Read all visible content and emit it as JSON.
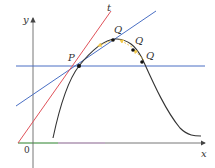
{
  "figure": {
    "axes": {
      "x_label": "x",
      "y_label": "y",
      "origin_label": "0"
    },
    "point_labels": {
      "p": "P",
      "q1": "Q",
      "q2": "Q",
      "q3": "Q",
      "tangent": "t"
    },
    "colors": {
      "axes": "#555555",
      "curve": "#333333",
      "tangent": "#e0525a",
      "secant": "#4a6fc4",
      "arrows": "#f2c84b",
      "green_segment": "#6cc46c",
      "purple_segment": "#b07ab8"
    }
  }
}
